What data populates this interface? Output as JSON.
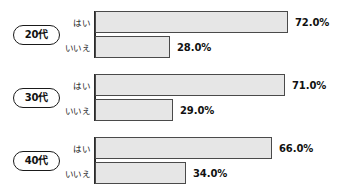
{
  "chart_data": {
    "type": "bar",
    "orientation": "horizontal",
    "title": "",
    "subtitle": "",
    "xlabel": "",
    "ylabel": "",
    "xlim": [
      0,
      100
    ],
    "grid": false,
    "legend": false,
    "value_suffix": "%",
    "categories": [
      "20代",
      "30代",
      "40代"
    ],
    "answers": [
      "はい",
      "いいえ"
    ],
    "series": [
      {
        "name": "はい",
        "values": [
          72.0,
          71.0,
          66.0
        ]
      },
      {
        "name": "いいえ",
        "values": [
          28.0,
          29.0,
          34.0
        ]
      }
    ],
    "groups": [
      {
        "age_label": "20代",
        "rows": [
          {
            "label": "はい",
            "value": 72.0,
            "value_text": "72.0%"
          },
          {
            "label": "いいえ",
            "value": 28.0,
            "value_text": "28.0%"
          }
        ]
      },
      {
        "age_label": "30代",
        "rows": [
          {
            "label": "はい",
            "value": 71.0,
            "value_text": "71.0%"
          },
          {
            "label": "いいえ",
            "value": 29.0,
            "value_text": "29.0%"
          }
        ]
      },
      {
        "age_label": "40代",
        "rows": [
          {
            "label": "はい",
            "value": 66.0,
            "value_text": "66.0%"
          },
          {
            "label": "いいえ",
            "value": 34.0,
            "value_text": "34.0%"
          }
        ]
      }
    ],
    "colors": {
      "bar_fill": "#e6e6e6",
      "bar_border": "#4a4a4a",
      "axis": "#2b2b2b",
      "text": "#111111",
      "pill_border": "#1a1a1a",
      "background": "#ffffff"
    }
  }
}
